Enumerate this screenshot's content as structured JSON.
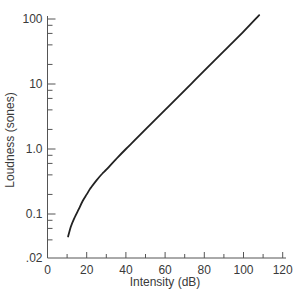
{
  "chart_data": {
    "type": "line",
    "title": "",
    "xlabel": "Intensity (dB)",
    "ylabel": "Loudness (sones)",
    "xlim": [
      0,
      120
    ],
    "ylim": [
      0.02,
      100
    ],
    "yscale": "log",
    "grid": false,
    "legend": null,
    "x_ticks": [
      0,
      20,
      40,
      60,
      80,
      100,
      120
    ],
    "x_tick_labels": [
      "0",
      "20",
      "40",
      "60",
      "80",
      "100",
      "120"
    ],
    "x_minor_ticks": [
      10,
      30,
      50,
      70,
      90,
      110
    ],
    "y_ticks": [
      0.02,
      0.1,
      1.0,
      10,
      100
    ],
    "y_tick_labels": [
      ".02",
      "0.1",
      "1.0",
      "10",
      "100"
    ],
    "y_minor_ticks": [
      0.04,
      0.06,
      0.08,
      0.2,
      0.4,
      0.6,
      0.8,
      2,
      4,
      6,
      8,
      20,
      40,
      60,
      80
    ],
    "series": [
      {
        "name": "Loudness",
        "color": "#222222",
        "x": [
          10.5,
          12,
          14,
          16,
          18,
          20,
          22,
          25,
          28,
          30,
          35,
          40,
          50,
          60,
          70,
          80,
          90,
          100,
          108
        ],
        "y": [
          0.045,
          0.065,
          0.09,
          0.12,
          0.16,
          0.2,
          0.25,
          0.33,
          0.42,
          0.48,
          0.7,
          1.0,
          2.0,
          4.0,
          8.0,
          16,
          32,
          64,
          115
        ]
      }
    ]
  }
}
